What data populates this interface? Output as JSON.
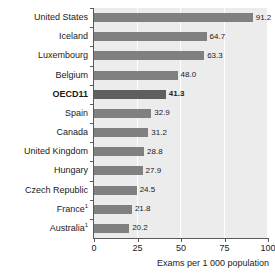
{
  "chart_data": {
    "type": "bar",
    "orientation": "horizontal",
    "title": "",
    "xlabel": "Exams per 1 000 population",
    "ylabel": "",
    "xlim": [
      0,
      100
    ],
    "xticks": [
      "0",
      "25",
      "50",
      "75",
      "100"
    ],
    "grid": true,
    "legend": "none",
    "categories": [
      "United States",
      "Iceland",
      "Luxembourg",
      "Belgium",
      "OECD11",
      "Spain",
      "Canada",
      "United Kingdom",
      "Hungary",
      "Czech Republic",
      "France",
      "Australia"
    ],
    "values": [
      91.2,
      64.7,
      63.3,
      48.0,
      41.3,
      32.9,
      31.2,
      28.8,
      27.9,
      24.5,
      21.8,
      20.2
    ],
    "value_labels": [
      "91.2",
      "64.7",
      "63.3",
      "48.0",
      "41.3",
      "32.9",
      "31.2",
      "28.8",
      "27.9",
      "24.5",
      "21.8",
      "20.2"
    ],
    "footnote_markers": [
      "",
      "",
      "",
      "",
      "",
      "",
      "",
      "",
      "",
      "",
      "1",
      "1"
    ],
    "highlighted": [
      "OECD11"
    ],
    "colors": {
      "bar": "#808080",
      "bar_highlight": "#5f5f5f",
      "plot_background": "#ececec",
      "gridline": "#ffffff",
      "axis": "#5a5a5a",
      "text": "#1a1a1a",
      "page_background": "#ffffff"
    }
  }
}
